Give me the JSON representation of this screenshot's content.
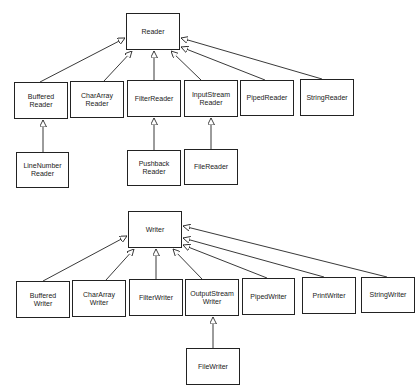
{
  "diagrams": [
    {
      "name": "reader-hierarchy",
      "root": {
        "id": "Reader",
        "label": "Reader",
        "box": [
          126,
          13,
          54,
          37
        ]
      },
      "nodes": [
        {
          "id": "BufferedReader",
          "label": "Buffered\nReader",
          "box": [
            14,
            82,
            54,
            37
          ],
          "parent": "Reader"
        },
        {
          "id": "CharArrayReader",
          "label": "CharArray\nReader",
          "box": [
            70,
            81,
            54,
            37
          ],
          "parent": "Reader"
        },
        {
          "id": "FilterReader",
          "label": "FilterReader",
          "box": [
            127,
            80,
            54,
            37
          ],
          "parent": "Reader"
        },
        {
          "id": "InputStreamReader",
          "label": "InputStream\nReader",
          "box": [
            184,
            80,
            54,
            37
          ],
          "parent": "Reader"
        },
        {
          "id": "PipedReader",
          "label": "PipedReader",
          "box": [
            240,
            80,
            54,
            36
          ],
          "parent": "Reader"
        },
        {
          "id": "StringReader",
          "label": "StringReader",
          "box": [
            300,
            79,
            54,
            37
          ],
          "parent": "Reader"
        },
        {
          "id": "LineNumberReader",
          "label": "LineNumber\nReader",
          "box": [
            16,
            152,
            53,
            36
          ],
          "parent": "BufferedReader"
        },
        {
          "id": "PushbackReader",
          "label": "Pushback\nReader",
          "box": [
            127,
            150,
            54,
            36
          ],
          "parent": "FilterReader"
        },
        {
          "id": "FileReader",
          "label": "FileReader",
          "box": [
            184,
            149,
            54,
            36
          ],
          "parent": "InputStreamReader"
        }
      ]
    },
    {
      "name": "writer-hierarchy",
      "root": {
        "id": "Writer",
        "label": "Writer",
        "box": [
          128,
          211,
          54,
          37
        ]
      },
      "nodes": [
        {
          "id": "BufferedWriter",
          "label": "Buffered\nWriter",
          "box": [
            16,
            281,
            54,
            37
          ],
          "parent": "Writer"
        },
        {
          "id": "CharArrayWriter",
          "label": "CharArray\nWriter",
          "box": [
            72,
            280,
            54,
            37
          ],
          "parent": "Writer"
        },
        {
          "id": "FilterWriter",
          "label": "FilterWriter",
          "box": [
            129,
            279,
            54,
            37
          ],
          "parent": "Writer"
        },
        {
          "id": "OutputStreamWriter",
          "label": "OutputStream\nWriter",
          "box": [
            185,
            279,
            54,
            37
          ],
          "parent": "Writer"
        },
        {
          "id": "PipedWriter",
          "label": "PipedWriter",
          "box": [
            242,
            278,
            53,
            37
          ],
          "parent": "Writer"
        },
        {
          "id": "PrintWriter",
          "label": "PrintWriter",
          "box": [
            302,
            277,
            54,
            37
          ],
          "parent": "Writer"
        },
        {
          "id": "StringWriter",
          "label": "StringWriter",
          "box": [
            361,
            277,
            54,
            36
          ],
          "parent": "Writer"
        },
        {
          "id": "FileWriter",
          "label": "FileWriter",
          "box": [
            186,
            348,
            54,
            37
          ],
          "parent": "OutputStreamWriter"
        }
      ]
    }
  ],
  "edges": [
    {
      "from": [
        40,
        82
      ],
      "to": [
        125,
        38
      ]
    },
    {
      "from": [
        104,
        81
      ],
      "to": [
        132,
        51
      ]
    },
    {
      "from": [
        154,
        80
      ],
      "to": [
        154,
        51
      ]
    },
    {
      "from": [
        201,
        80
      ],
      "to": [
        171,
        51
      ]
    },
    {
      "from": [
        265,
        80
      ],
      "to": [
        181,
        47
      ]
    },
    {
      "from": [
        322,
        79
      ],
      "to": [
        181,
        38
      ]
    },
    {
      "from": [
        43,
        152
      ],
      "to": [
        43,
        120
      ]
    },
    {
      "from": [
        154,
        150
      ],
      "to": [
        154,
        118
      ]
    },
    {
      "from": [
        211,
        149
      ],
      "to": [
        211,
        118
      ]
    },
    {
      "from": [
        43,
        281
      ],
      "to": [
        127,
        236
      ]
    },
    {
      "from": [
        106,
        280
      ],
      "to": [
        134,
        249
      ]
    },
    {
      "from": [
        156,
        279
      ],
      "to": [
        156,
        249
      ]
    },
    {
      "from": [
        202,
        279
      ],
      "to": [
        173,
        249
      ]
    },
    {
      "from": [
        267,
        278
      ],
      "to": [
        183,
        245
      ]
    },
    {
      "from": [
        324,
        277
      ],
      "to": [
        183,
        238
      ]
    },
    {
      "from": [
        387,
        277
      ],
      "to": [
        183,
        226
      ]
    },
    {
      "from": [
        213,
        348
      ],
      "to": [
        213,
        317
      ]
    }
  ],
  "colors": {
    "line": "#222222",
    "box_border": "#222222",
    "background": "#ffffff"
  }
}
